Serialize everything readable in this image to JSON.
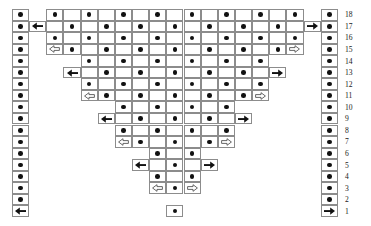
{
  "chart_data": {
    "type": "heatmap",
    "title": "",
    "subtitle": "",
    "xlabel": "",
    "ylabel": "",
    "grid": true,
    "legend_position": "none",
    "columns": 19,
    "rows": 18,
    "row_labels": [
      "18",
      "17",
      "16",
      "15",
      "14",
      "13",
      "12",
      "11",
      "10",
      "9",
      "8",
      "7",
      "6",
      "5",
      "4",
      "3",
      "2",
      "1"
    ],
    "column_labels": [],
    "symbol_legend": {
      "dot": "filled-dot",
      "arrow_left_solid": "solid-left-arrow",
      "arrow_right_solid": "solid-right-arrow",
      "arrow_left_hollow": "hollow-left-arrow",
      "arrow_right_hollow": "hollow-right-arrow",
      "empty": "blank-cell"
    },
    "colors": {
      "symbol": "#111111",
      "gridline": "#8c8c8c",
      "background": "#ffffff",
      "label": "#1a1a1a"
    },
    "geometry": {
      "grid_left": 12,
      "grid_top": 9,
      "cell_width": 17.15,
      "cell_height": 11.55,
      "rownum_x": 345
    },
    "rows_data": [
      {
        "row": "18",
        "cells": [
          "dot",
          "",
          "dot",
          "",
          "dot",
          "",
          "dot",
          "",
          "dot",
          "",
          "dot",
          "",
          "dot",
          "",
          "dot",
          "",
          "dot",
          "",
          "dot"
        ]
      },
      {
        "row": "17",
        "cells": [
          "dot",
          "arrow_left_solid",
          "",
          "dot",
          "",
          "dot",
          "",
          "dot",
          "",
          "dot",
          "",
          "dot",
          "",
          "dot",
          "",
          "dot",
          "",
          "arrow_right_solid",
          "dot"
        ]
      },
      {
        "row": "16",
        "cells": [
          "dot",
          "",
          "dot",
          "",
          "dot",
          "",
          "dot",
          "",
          "dot",
          "",
          "dot",
          "",
          "dot",
          "",
          "dot",
          "",
          "dot",
          "",
          "dot"
        ]
      },
      {
        "row": "15",
        "cells": [
          "dot",
          "",
          "arrow_left_hollow",
          "dot",
          "",
          "dot",
          "",
          "dot",
          "",
          "dot",
          "",
          "dot",
          "",
          "dot",
          "",
          "dot",
          "arrow_right_hollow",
          "",
          "dot"
        ]
      },
      {
        "row": "14",
        "cells": [
          "dot",
          "",
          "",
          "",
          "dot",
          "",
          "dot",
          "",
          "dot",
          "",
          "dot",
          "",
          "dot",
          "",
          "dot",
          "",
          "",
          "",
          "dot"
        ]
      },
      {
        "row": "13",
        "cells": [
          "dot",
          "",
          "",
          "arrow_left_solid",
          "",
          "dot",
          "",
          "dot",
          "",
          "dot",
          "",
          "dot",
          "",
          "dot",
          "",
          "arrow_right_solid",
          "",
          "",
          "dot"
        ]
      },
      {
        "row": "12",
        "cells": [
          "dot",
          "",
          "",
          "",
          "dot",
          "",
          "dot",
          "",
          "dot",
          "",
          "dot",
          "",
          "dot",
          "",
          "dot",
          "",
          "",
          "",
          "dot"
        ]
      },
      {
        "row": "11",
        "cells": [
          "dot",
          "",
          "",
          "",
          "arrow_left_hollow",
          "dot",
          "",
          "dot",
          "",
          "dot",
          "",
          "dot",
          "",
          "dot",
          "arrow_right_hollow",
          "",
          "",
          "",
          "dot"
        ]
      },
      {
        "row": "10",
        "cells": [
          "dot",
          "",
          "",
          "",
          "",
          "",
          "dot",
          "",
          "dot",
          "",
          "dot",
          "",
          "dot",
          "",
          "",
          "",
          "",
          "",
          "dot"
        ]
      },
      {
        "row": "9",
        "cells": [
          "dot",
          "",
          "",
          "",
          "",
          "arrow_left_solid",
          "",
          "dot",
          "",
          "dot",
          "",
          "dot",
          "",
          "arrow_right_solid",
          "",
          "",
          "",
          "",
          "dot"
        ]
      },
      {
        "row": "8",
        "cells": [
          "dot",
          "",
          "",
          "",
          "",
          "",
          "dot",
          "",
          "dot",
          "",
          "dot",
          "",
          "dot",
          "",
          "",
          "",
          "",
          "",
          "dot"
        ]
      },
      {
        "row": "7",
        "cells": [
          "dot",
          "",
          "",
          "",
          "",
          "",
          "arrow_left_hollow",
          "dot",
          "",
          "dot",
          "",
          "dot",
          "arrow_right_hollow",
          "",
          "",
          "",
          "",
          "",
          "dot"
        ]
      },
      {
        "row": "6",
        "cells": [
          "dot",
          "",
          "",
          "",
          "",
          "",
          "",
          "",
          "dot",
          "",
          "dot",
          "",
          "",
          "",
          "",
          "",
          "",
          "",
          "dot"
        ]
      },
      {
        "row": "5",
        "cells": [
          "dot",
          "",
          "",
          "",
          "",
          "",
          "",
          "arrow_left_solid",
          "",
          "dot",
          "",
          "arrow_right_solid",
          "",
          "",
          "",
          "",
          "",
          "",
          "dot"
        ]
      },
      {
        "row": "4",
        "cells": [
          "dot",
          "",
          "",
          "",
          "",
          "",
          "",
          "",
          "dot",
          "",
          "dot",
          "",
          "",
          "",
          "",
          "",
          "",
          "",
          "dot"
        ]
      },
      {
        "row": "3",
        "cells": [
          "dot",
          "",
          "",
          "",
          "",
          "",
          "",
          "",
          "arrow_left_hollow",
          "dot",
          "arrow_right_hollow",
          "",
          "",
          "",
          "",
          "",
          "",
          "",
          "dot"
        ]
      },
      {
        "row": "2",
        "cells": [
          "dot",
          "",
          "",
          "",
          "",
          "",
          "",
          "",
          "",
          "",
          "",
          "",
          "",
          "",
          "",
          "",
          "",
          "",
          "dot"
        ]
      },
      {
        "row": "1",
        "cells": [
          "arrow_left_solid",
          "",
          "",
          "",
          "",
          "",
          "",
          "",
          "",
          "dot",
          "",
          "",
          "",
          "",
          "",
          "",
          "",
          "",
          "arrow_right_solid"
        ]
      }
    ]
  }
}
